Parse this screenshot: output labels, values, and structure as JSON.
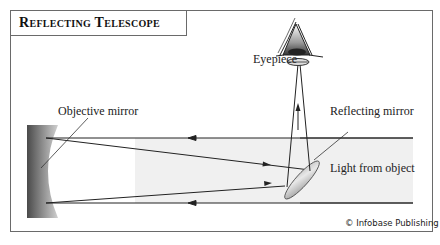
{
  "title": "Reflecting Telescope",
  "labels": {
    "eyepiece": "Eyepiece",
    "objective_mirror": "Objective mirror",
    "reflecting_mirror": "Reflecting mirror",
    "light_from_object": "Light from object"
  },
  "credit": "© Infobase Publishing",
  "colors": {
    "frame": "#6a6a6a",
    "light_band": "#eeeeee",
    "mirror_dark": "#555555",
    "mirror_light": "#cfcfcf",
    "rays": "#222222"
  }
}
